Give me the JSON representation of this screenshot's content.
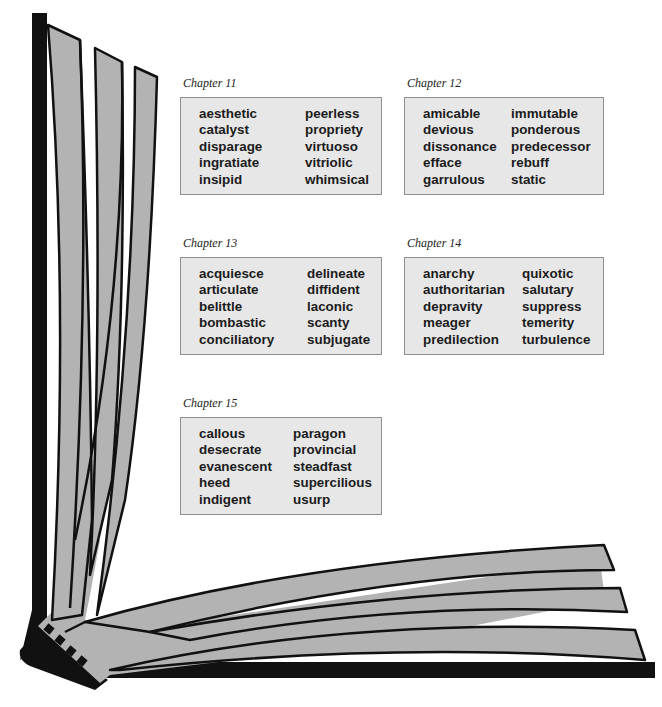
{
  "colors": {
    "page_fill": "#b3b3b3",
    "outline": "#111111",
    "box_fill": "#e7e7e7",
    "box_border": "#8f8f8f"
  },
  "chapters": [
    {
      "label": "Chapter 11",
      "columns": [
        [
          "aesthetic",
          "catalyst",
          "disparage",
          "ingratiate",
          "insipid"
        ],
        [
          "peerless",
          "propriety",
          "virtuoso",
          "vitriolic",
          "whimsical"
        ]
      ]
    },
    {
      "label": "Chapter 12",
      "columns": [
        [
          "amicable",
          "devious",
          "dissonance",
          "efface",
          "garrulous"
        ],
        [
          "immutable",
          "ponderous",
          "predecessor",
          "rebuff",
          "static"
        ]
      ]
    },
    {
      "label": "Chapter 13",
      "columns": [
        [
          "acquiesce",
          "articulate",
          "belittle",
          "bombastic",
          "conciliatory"
        ],
        [
          "delineate",
          "diffident",
          "laconic",
          "scanty",
          "subjugate"
        ]
      ]
    },
    {
      "label": "Chapter 14",
      "columns": [
        [
          "anarchy",
          "authoritarian",
          "depravity",
          "meager",
          "predilection"
        ],
        [
          "quixotic",
          "salutary",
          "suppress",
          "temerity",
          "turbulence"
        ]
      ]
    },
    {
      "label": "Chapter 15",
      "columns": [
        [
          "callous",
          "desecrate",
          "evanescent",
          "heed",
          "indigent"
        ],
        [
          "paragon",
          "provincial",
          "steadfast",
          "supercilious",
          "usurp"
        ]
      ]
    }
  ]
}
